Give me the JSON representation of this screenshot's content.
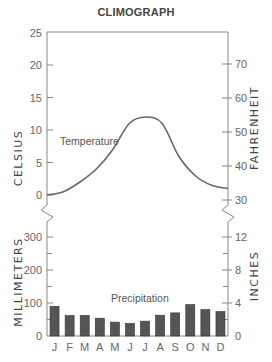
{
  "chart": {
    "title": "CLIMOGRAPH",
    "left_top_axis_label": "CELSIUS",
    "right_top_axis_label": "FAHRENHEIT",
    "left_bottom_axis_label": "MILLIMETERS",
    "right_bottom_axis_label": "INCHES",
    "temperature_label": "Temperature",
    "precipitation_label": "Precipitation",
    "months": [
      "J",
      "F",
      "M",
      "A",
      "M",
      "J",
      "J",
      "A",
      "S",
      "O",
      "N",
      "D"
    ],
    "celsius_ticks": [
      "25",
      "20",
      "15",
      "10",
      "5",
      "0"
    ],
    "fahrenheit_ticks": [
      "70",
      "60",
      "50",
      "40",
      "30"
    ],
    "millimeter_ticks": [
      "300",
      "200",
      "100",
      "0"
    ],
    "inch_ticks": [
      "12",
      "8",
      "4",
      "0"
    ],
    "colors": {
      "bar": "#555555",
      "line": "#666666",
      "axis": "#888888"
    }
  },
  "chart_data": [
    {
      "type": "line",
      "title": "CLIMOGRAPH",
      "series": [
        {
          "name": "Temperature",
          "values": [
            0,
            0.5,
            2,
            4,
            7,
            11,
            12,
            11,
            6,
            3,
            1.5,
            1
          ]
        }
      ],
      "categories": [
        "J",
        "F",
        "M",
        "A",
        "M",
        "J",
        "J",
        "A",
        "S",
        "O",
        "N",
        "D"
      ],
      "ylabel": "CELSIUS",
      "ylabel_right": "FAHRENHEIT",
      "ylim": [
        0,
        25
      ],
      "ylim_right_fahrenheit": [
        30,
        77
      ],
      "y_ticks": [
        0,
        5,
        10,
        15,
        20,
        25
      ],
      "y_ticks_right": [
        30,
        40,
        50,
        60,
        70
      ],
      "grid": false
    },
    {
      "type": "bar",
      "series": [
        {
          "name": "Precipitation",
          "values": [
            90,
            62,
            62,
            54,
            42,
            38,
            45,
            63,
            70,
            95,
            80,
            74
          ]
        }
      ],
      "categories": [
        "J",
        "F",
        "M",
        "A",
        "M",
        "J",
        "J",
        "A",
        "S",
        "O",
        "N",
        "D"
      ],
      "ylabel": "MILLIMETERS",
      "ylabel_right": "INCHES",
      "ylim": [
        0,
        350
      ],
      "y_ticks": [
        0,
        100,
        200,
        300
      ],
      "y_ticks_right": [
        0,
        4,
        8,
        12
      ],
      "grid": false
    }
  ]
}
